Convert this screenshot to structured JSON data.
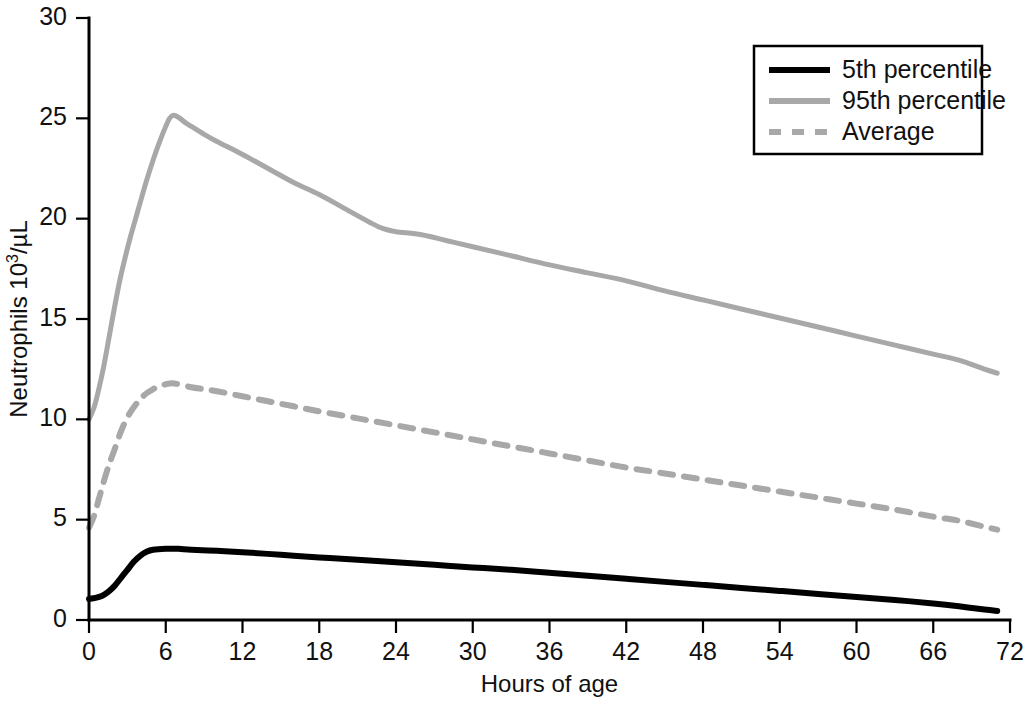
{
  "chart_data": {
    "type": "line",
    "title": "",
    "subtitle": "",
    "xlabel": "Hours of age",
    "ylabel": "Neutrophils 10³/µL",
    "ylabel_parts": {
      "base": "Neutrophils 10",
      "sup": "3",
      "tail": "/µL"
    },
    "xlim": [
      0,
      72
    ],
    "ylim": [
      0,
      30
    ],
    "xticks": [
      0,
      6,
      12,
      18,
      24,
      30,
      36,
      42,
      48,
      54,
      60,
      66,
      72
    ],
    "yticks": [
      0,
      5,
      10,
      15,
      20,
      25,
      30
    ],
    "xtick_labels": [
      "0",
      "6",
      "12",
      "18",
      "24",
      "30",
      "36",
      "42",
      "48",
      "54",
      "60",
      "66",
      "72"
    ],
    "ytick_labels": [
      "0",
      "5",
      "10",
      "15",
      "20",
      "25",
      "30"
    ],
    "grid": false,
    "legend_position": "top-right",
    "legend_entries": [
      "5th percentile",
      "95th percentile",
      "Average"
    ],
    "series": [
      {
        "name": "5th percentile",
        "color": "#000000",
        "style": "solid",
        "width": 6,
        "x": [
          0,
          0.5,
          1,
          1.5,
          2,
          2.5,
          3,
          3.5,
          4,
          4.5,
          5,
          6,
          7,
          8,
          10,
          12,
          15,
          18,
          21,
          24,
          27,
          30,
          33,
          36,
          39,
          42,
          45,
          48,
          51,
          54,
          57,
          60,
          63,
          66,
          68,
          70,
          71
        ],
        "values": [
          1.05,
          1.1,
          1.2,
          1.4,
          1.7,
          2.1,
          2.5,
          2.9,
          3.2,
          3.4,
          3.5,
          3.55,
          3.55,
          3.5,
          3.45,
          3.38,
          3.25,
          3.12,
          3.0,
          2.88,
          2.75,
          2.62,
          2.5,
          2.35,
          2.2,
          2.05,
          1.9,
          1.75,
          1.6,
          1.45,
          1.3,
          1.15,
          1.0,
          0.82,
          0.68,
          0.52,
          0.45
        ]
      },
      {
        "name": "95th percentile",
        "color": "#a8a8a8",
        "style": "solid",
        "width": 5,
        "x": [
          0,
          0.4,
          0.8,
          1.2,
          1.6,
          2,
          2.4,
          2.8,
          3.2,
          3.6,
          4,
          4.5,
          5,
          5.5,
          6,
          6.3,
          6.6,
          7,
          7.5,
          8,
          9,
          10,
          12,
          14,
          16,
          18,
          20,
          22,
          23,
          24,
          26,
          28,
          30,
          33,
          36,
          39,
          42,
          45,
          48,
          51,
          54,
          57,
          60,
          63,
          66,
          68,
          70,
          71
        ],
        "values": [
          10.0,
          10.6,
          11.6,
          12.8,
          14.2,
          15.6,
          16.9,
          18.0,
          19.0,
          19.9,
          20.8,
          21.9,
          22.9,
          23.8,
          24.6,
          25.0,
          25.15,
          25.05,
          24.8,
          24.6,
          24.2,
          23.85,
          23.2,
          22.5,
          21.8,
          21.2,
          20.5,
          19.8,
          19.5,
          19.35,
          19.2,
          18.9,
          18.6,
          18.15,
          17.7,
          17.3,
          16.9,
          16.4,
          15.95,
          15.5,
          15.05,
          14.6,
          14.15,
          13.7,
          13.25,
          12.95,
          12.5,
          12.3
        ]
      },
      {
        "name": "Average",
        "color": "#a8a8a8",
        "style": "dashed",
        "width": 6,
        "x": [
          0,
          0.4,
          0.8,
          1.2,
          1.6,
          2,
          2.5,
          3,
          3.5,
          4,
          4.5,
          5,
          5.5,
          6,
          6.5,
          7,
          8,
          9,
          10,
          12,
          14,
          16,
          18,
          21,
          24,
          27,
          30,
          33,
          36,
          39,
          42,
          45,
          48,
          51,
          54,
          57,
          60,
          63,
          66,
          68,
          70,
          71
        ],
        "values": [
          4.6,
          5.2,
          6.1,
          7.0,
          7.8,
          8.5,
          9.4,
          10.1,
          10.6,
          11.0,
          11.3,
          11.5,
          11.65,
          11.75,
          11.8,
          11.75,
          11.6,
          11.5,
          11.4,
          11.15,
          10.9,
          10.65,
          10.4,
          10.05,
          9.7,
          9.35,
          9.0,
          8.65,
          8.3,
          7.95,
          7.6,
          7.3,
          7.0,
          6.7,
          6.4,
          6.1,
          5.8,
          5.5,
          5.15,
          4.95,
          4.65,
          4.5
        ]
      }
    ]
  },
  "legend": {
    "items": [
      {
        "label": "5th percentile",
        "color": "#000000",
        "style": "solid",
        "width": 6
      },
      {
        "label": "95th percentile",
        "color": "#a8a8a8",
        "style": "solid",
        "width": 6
      },
      {
        "label": "Average",
        "color": "#a8a8a8",
        "style": "dashed",
        "width": 6
      }
    ]
  },
  "colors": {
    "background": "#ffffff",
    "axis": "#000000",
    "percentile_5": "#000000",
    "percentile_95": "#a8a8a8",
    "average": "#a8a8a8"
  },
  "geometry": {
    "plot_left": 89,
    "plot_right": 1010,
    "plot_top": 18,
    "plot_bottom": 620
  }
}
